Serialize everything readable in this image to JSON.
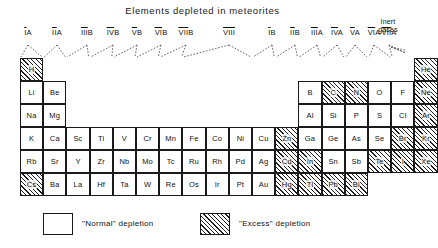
{
  "title": "Elements depleted in meteorites",
  "group_headers": [
    {
      "label": "IA",
      "overline": "I",
      "rest": "A",
      "x": 28
    },
    {
      "label": "IIA",
      "overline": "II",
      "rest": "A",
      "x": 57
    },
    {
      "label": "IIIB",
      "overline": "III",
      "rest": "B",
      "x": 87
    },
    {
      "label": "IVB",
      "overline": "IV",
      "rest": "B",
      "x": 113
    },
    {
      "label": "VB",
      "overline": "V",
      "rest": "B",
      "x": 137
    },
    {
      "label": "VIB",
      "overline": "VI",
      "rest": "B",
      "x": 161
    },
    {
      "label": "VIIB",
      "overline": "VII",
      "rest": "B",
      "x": 186
    },
    {
      "label": "VIII",
      "overline": "VIII",
      "rest": "",
      "x": 229
    },
    {
      "label": "IB",
      "overline": "I",
      "rest": "B",
      "x": 272
    },
    {
      "label": "IIB",
      "overline": "II",
      "rest": "B",
      "x": 295
    },
    {
      "label": "IIIA",
      "overline": "III",
      "rest": "A",
      "x": 317
    },
    {
      "label": "IVA",
      "overline": "IV",
      "rest": "A",
      "x": 337
    },
    {
      "label": "VA",
      "overline": "V",
      "rest": "A",
      "x": 355
    },
    {
      "label": "VIA",
      "overline": "VI",
      "rest": "A",
      "x": 374
    },
    {
      "label": "VIIA",
      "overline": "VII",
      "rest": "A",
      "x": 389
    }
  ],
  "inert_gases_label_line1": "Inert",
  "inert_gases_label_line2": "gases",
  "legend": {
    "normal_label": "\"Normal\" depletion",
    "excess_label": "\"Excess\" depletion"
  },
  "depletion_key": {
    "normal": "normal",
    "excess": "excess"
  },
  "chart_data": {
    "type": "table",
    "title": "Elements depleted in meteorites",
    "legend_entries": [
      "\"Normal\" depletion",
      "\"Excess\" depletion"
    ],
    "column_groups": [
      "IA",
      "IIA",
      "IIIB",
      "IVB",
      "VB",
      "VIB",
      "VIIB",
      "VIII",
      "VIII",
      "VIII",
      "IB",
      "IIB",
      "IIIA",
      "IVA",
      "VA",
      "VIA",
      "VIIA",
      "Inert gases"
    ],
    "cells": [
      {
        "symbol": "H",
        "col": 1,
        "row": 1,
        "fill": "excess"
      },
      {
        "symbol": "He",
        "col": 18,
        "row": 1,
        "fill": "excess"
      },
      {
        "symbol": "Li",
        "col": 1,
        "row": 2,
        "fill": "normal"
      },
      {
        "symbol": "Be",
        "col": 2,
        "row": 2,
        "fill": "normal"
      },
      {
        "symbol": "B",
        "col": 13,
        "row": 2,
        "fill": "normal"
      },
      {
        "symbol": "C",
        "col": 14,
        "row": 2,
        "fill": "excess"
      },
      {
        "symbol": "N",
        "col": 15,
        "row": 2,
        "fill": "excess"
      },
      {
        "symbol": "O",
        "col": 16,
        "row": 2,
        "fill": "normal"
      },
      {
        "symbol": "F",
        "col": 17,
        "row": 2,
        "fill": "normal"
      },
      {
        "symbol": "Ne",
        "col": 18,
        "row": 2,
        "fill": "excess"
      },
      {
        "symbol": "Na",
        "col": 1,
        "row": 3,
        "fill": "normal"
      },
      {
        "symbol": "Mg",
        "col": 2,
        "row": 3,
        "fill": "normal"
      },
      {
        "symbol": "Al",
        "col": 13,
        "row": 3,
        "fill": "normal"
      },
      {
        "symbol": "Si",
        "col": 14,
        "row": 3,
        "fill": "normal"
      },
      {
        "symbol": "P",
        "col": 15,
        "row": 3,
        "fill": "normal"
      },
      {
        "symbol": "S",
        "col": 16,
        "row": 3,
        "fill": "normal"
      },
      {
        "symbol": "Cl",
        "col": 17,
        "row": 3,
        "fill": "normal"
      },
      {
        "symbol": "Ar",
        "col": 18,
        "row": 3,
        "fill": "excess"
      },
      {
        "symbol": "K",
        "col": 1,
        "row": 4,
        "fill": "normal"
      },
      {
        "symbol": "Ca",
        "col": 2,
        "row": 4,
        "fill": "normal"
      },
      {
        "symbol": "Sc",
        "col": 3,
        "row": 4,
        "fill": "normal"
      },
      {
        "symbol": "Ti",
        "col": 4,
        "row": 4,
        "fill": "normal"
      },
      {
        "symbol": "V",
        "col": 5,
        "row": 4,
        "fill": "normal"
      },
      {
        "symbol": "Cr",
        "col": 6,
        "row": 4,
        "fill": "normal"
      },
      {
        "symbol": "Mn",
        "col": 7,
        "row": 4,
        "fill": "normal"
      },
      {
        "symbol": "Fe",
        "col": 8,
        "row": 4,
        "fill": "normal"
      },
      {
        "symbol": "Co",
        "col": 9,
        "row": 4,
        "fill": "normal"
      },
      {
        "symbol": "Ni",
        "col": 10,
        "row": 4,
        "fill": "normal"
      },
      {
        "symbol": "Cu",
        "col": 11,
        "row": 4,
        "fill": "normal"
      },
      {
        "symbol": "Zn",
        "col": 12,
        "row": 4,
        "fill": "excess"
      },
      {
        "symbol": "Ga",
        "col": 13,
        "row": 4,
        "fill": "normal"
      },
      {
        "symbol": "Ge",
        "col": 14,
        "row": 4,
        "fill": "normal"
      },
      {
        "symbol": "As",
        "col": 15,
        "row": 4,
        "fill": "normal"
      },
      {
        "symbol": "Se",
        "col": 16,
        "row": 4,
        "fill": "normal"
      },
      {
        "symbol": "Br",
        "col": 17,
        "row": 4,
        "fill": "excess"
      },
      {
        "symbol": "Kr",
        "col": 18,
        "row": 4,
        "fill": "excess"
      },
      {
        "symbol": "Rb",
        "col": 1,
        "row": 5,
        "fill": "normal"
      },
      {
        "symbol": "Sr",
        "col": 2,
        "row": 5,
        "fill": "normal"
      },
      {
        "symbol": "Y",
        "col": 3,
        "row": 5,
        "fill": "normal"
      },
      {
        "symbol": "Zr",
        "col": 4,
        "row": 5,
        "fill": "normal"
      },
      {
        "symbol": "Nb",
        "col": 5,
        "row": 5,
        "fill": "normal"
      },
      {
        "symbol": "Mo",
        "col": 6,
        "row": 5,
        "fill": "normal"
      },
      {
        "symbol": "Tc",
        "col": 7,
        "row": 5,
        "fill": "normal"
      },
      {
        "symbol": "Ru",
        "col": 8,
        "row": 5,
        "fill": "normal"
      },
      {
        "symbol": "Rh",
        "col": 9,
        "row": 5,
        "fill": "normal"
      },
      {
        "symbol": "Pd",
        "col": 10,
        "row": 5,
        "fill": "normal"
      },
      {
        "symbol": "Ag",
        "col": 11,
        "row": 5,
        "fill": "normal"
      },
      {
        "symbol": "Cd",
        "col": 12,
        "row": 5,
        "fill": "excess"
      },
      {
        "symbol": "In",
        "col": 13,
        "row": 5,
        "fill": "excess"
      },
      {
        "symbol": "Sn",
        "col": 14,
        "row": 5,
        "fill": "normal"
      },
      {
        "symbol": "Sb",
        "col": 15,
        "row": 5,
        "fill": "normal"
      },
      {
        "symbol": "Te",
        "col": 16,
        "row": 5,
        "fill": "excess"
      },
      {
        "symbol": "I",
        "col": 17,
        "row": 5,
        "fill": "excess"
      },
      {
        "symbol": "Xe",
        "col": 18,
        "row": 5,
        "fill": "excess"
      },
      {
        "symbol": "Cs",
        "col": 1,
        "row": 6,
        "fill": "excess"
      },
      {
        "symbol": "Ba",
        "col": 2,
        "row": 6,
        "fill": "normal"
      },
      {
        "symbol": "La",
        "col": 3,
        "row": 6,
        "fill": "normal"
      },
      {
        "symbol": "Hf",
        "col": 4,
        "row": 6,
        "fill": "normal"
      },
      {
        "symbol": "Ta",
        "col": 5,
        "row": 6,
        "fill": "normal"
      },
      {
        "symbol": "W",
        "col": 6,
        "row": 6,
        "fill": "normal"
      },
      {
        "symbol": "Re",
        "col": 7,
        "row": 6,
        "fill": "normal"
      },
      {
        "symbol": "Os",
        "col": 8,
        "row": 6,
        "fill": "normal"
      },
      {
        "symbol": "Ir",
        "col": 9,
        "row": 6,
        "fill": "normal"
      },
      {
        "symbol": "Pt",
        "col": 10,
        "row": 6,
        "fill": "normal"
      },
      {
        "symbol": "Au",
        "col": 11,
        "row": 6,
        "fill": "normal"
      },
      {
        "symbol": "Hg",
        "col": 12,
        "row": 6,
        "fill": "excess"
      },
      {
        "symbol": "Tl",
        "col": 13,
        "row": 6,
        "fill": "excess"
      },
      {
        "symbol": "Pb",
        "col": 14,
        "row": 6,
        "fill": "excess"
      },
      {
        "symbol": "Bi",
        "col": 15,
        "row": 6,
        "fill": "excess"
      }
    ]
  }
}
